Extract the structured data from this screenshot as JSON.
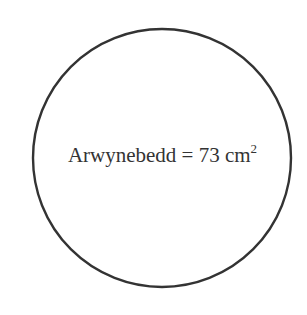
{
  "diagram": {
    "shape": "circle",
    "circle": {
      "cx": 162,
      "cy": 158,
      "r": 129,
      "stroke": "#333333",
      "stroke_width": 2.4,
      "fill": "#ffffff"
    },
    "label": {
      "term": "Arwynebedd",
      "equals": "=",
      "value": "73",
      "unit": "cm",
      "exponent": "2"
    }
  }
}
